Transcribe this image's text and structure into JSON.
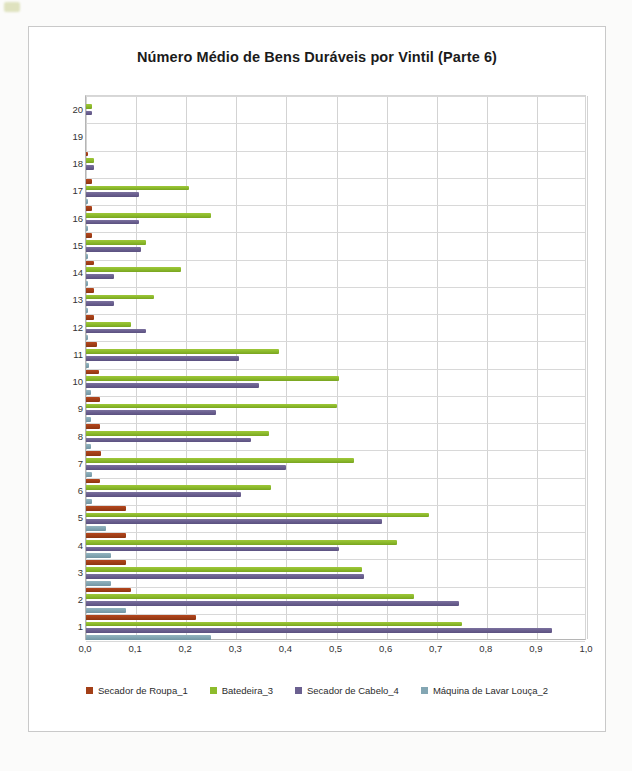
{
  "chart_data": {
    "type": "bar",
    "orientation": "horizontal",
    "title": "Número Médio de Bens Duráveis por Vintil (Parte 6)",
    "xlabel": "",
    "ylabel": "",
    "xlim": [
      0.0,
      1.0
    ],
    "xticks": [
      0.0,
      0.1,
      0.2,
      0.3,
      0.4,
      0.5,
      0.6,
      0.7,
      0.8,
      0.9,
      1.0
    ],
    "xtick_labels": [
      "0,0",
      "0,1",
      "0,2",
      "0,3",
      "0,4",
      "0,5",
      "0,6",
      "0,7",
      "0,8",
      "0,9",
      "1,0"
    ],
    "grid": true,
    "legend_position": "bottom",
    "categories": [
      20,
      19,
      18,
      17,
      16,
      15,
      14,
      13,
      12,
      11,
      10,
      9,
      8,
      7,
      6,
      5,
      4,
      3,
      2,
      1
    ],
    "category_labels": [
      "20",
      "19",
      "18",
      "17",
      "16",
      "15",
      "14",
      "13",
      "12",
      "11",
      "10",
      "9",
      "8",
      "7",
      "6",
      "5",
      "4",
      "3",
      "2",
      "1"
    ],
    "series": [
      {
        "name": "Secador de Roupa_1",
        "color": "#a33f17",
        "values": [
          0.0,
          0.0,
          0.003,
          0.012,
          0.012,
          0.012,
          0.016,
          0.016,
          0.016,
          0.022,
          0.025,
          0.028,
          0.028,
          0.03,
          0.028,
          0.08,
          0.08,
          0.08,
          0.09,
          0.22
        ]
      },
      {
        "name": "Batedeira_3",
        "color": "#8dbc2c",
        "values": [
          0.012,
          0.0,
          0.016,
          0.205,
          0.25,
          0.12,
          0.19,
          0.135,
          0.09,
          0.385,
          0.505,
          0.5,
          0.365,
          0.535,
          0.37,
          0.685,
          0.62,
          0.55,
          0.655,
          0.75
        ]
      },
      {
        "name": "Secador de Cabelo_4",
        "color": "#6b6090",
        "values": [
          0.012,
          0.0,
          0.016,
          0.105,
          0.105,
          0.11,
          0.055,
          0.055,
          0.12,
          0.305,
          0.345,
          0.26,
          0.33,
          0.4,
          0.31,
          0.59,
          0.505,
          0.555,
          0.745,
          0.93
        ]
      },
      {
        "name": "Máquina de Lavar Louça_2",
        "color": "#83a6b3",
        "values": [
          0.0,
          0.0,
          0.0,
          0.004,
          0.004,
          0.004,
          0.004,
          0.004,
          0.004,
          0.006,
          0.01,
          0.01,
          0.01,
          0.012,
          0.012,
          0.04,
          0.05,
          0.05,
          0.08,
          0.25
        ]
      }
    ]
  },
  "legend": {
    "items": [
      {
        "label": "Secador de Roupa_1",
        "color": "#a33f17"
      },
      {
        "label": "Batedeira_3",
        "color": "#8dbc2c"
      },
      {
        "label": "Secador de Cabelo_4",
        "color": "#6b6090"
      },
      {
        "label": "Máquina de Lavar Louça_2",
        "color": "#83a6b3"
      }
    ]
  }
}
